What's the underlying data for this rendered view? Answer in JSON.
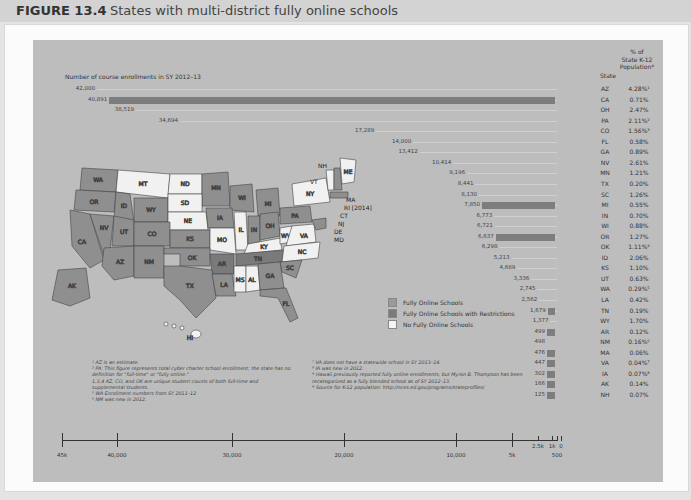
{
  "figure": {
    "number": "FIGURE 13.4",
    "title": "States with multi-district fully online schools"
  },
  "headers": {
    "enrollments": "Number of course enrollments in SY 2012–13",
    "state": "State",
    "pct_line1": "% of",
    "pct_line2": "State K-12",
    "pct_line3": "Population*"
  },
  "legend": {
    "items": [
      {
        "label": "Fully Online Schools",
        "color": "#9a9a9a"
      },
      {
        "label": "Fully Online Schools with Restrictions",
        "color": "#7a7a7a"
      },
      {
        "label": "No Fully Online Schools",
        "color": "#f4f4f4"
      }
    ]
  },
  "notes_left": [
    "¹ AZ is an estimate.",
    "² PA: This figure represents total cyber charter school enrollment; the state has no definition for \"full-time\" or \"fully online.\"",
    "1,3,4 AZ, CO, and OK are unique student counts of both full-time and supplemental students.",
    "⁵ WA Enrollment numbers from SY 2011–12",
    "⁶ NM was new in 2012."
  ],
  "notes_right": [
    "⁷ VA does not have a statewide school in SY 2013–14.",
    "⁸ IA was new in 2012.",
    "* Hawaii previously reported fully online enrollments, but Myron B. Thompson has been recategorized as a fully blended school as of SY 2012–13.",
    "* Source for K-12 population: http://nces.ed.gov/programs/stateprofiles/"
  ],
  "map_labels": {
    "ri": "RI [2014]",
    "hi": "HI"
  },
  "axis": {
    "ticks": [
      {
        "label": "45k",
        "x": 62
      },
      {
        "label": "40,000",
        "x": 117
      },
      {
        "label": "30,000",
        "x": 232
      },
      {
        "label": "20,000",
        "x": 344
      },
      {
        "label": "10,000",
        "x": 456
      },
      {
        "label": "5k",
        "x": 512
      },
      {
        "label": "2.5k",
        "x": 538
      },
      {
        "label": "1k",
        "x": 552
      },
      {
        "label": "500",
        "x": 557
      },
      {
        "label": "0",
        "x": 561
      }
    ]
  },
  "chart_data": {
    "type": "bar",
    "title": "States with multi-district fully online schools",
    "xlabel": "Number of course enrollments in SY 2012–13",
    "ylabel": "State",
    "axis_ticks": [
      "45k",
      "40,000",
      "30,000",
      "20,000",
      "10,000",
      "5k",
      "2.5k",
      "1k",
      "500",
      "0"
    ],
    "categories": [
      "AZ",
      "CA",
      "OH",
      "PA",
      "CO",
      "FL",
      "GA",
      "NV",
      "MN",
      "TX",
      "SC",
      "MI",
      "IN",
      "WI",
      "OR",
      "OK",
      "ID",
      "KS",
      "UT",
      "WA",
      "LA",
      "TN",
      "WY",
      "AR",
      "NM",
      "MA",
      "VA",
      "IA",
      "AK",
      "NH"
    ],
    "values": [
      42000,
      40891,
      38519,
      34694,
      17289,
      14000,
      13412,
      10414,
      9196,
      8441,
      8130,
      7850,
      6773,
      6721,
      6637,
      6298,
      5213,
      4689,
      3336,
      2745,
      2562,
      1679,
      1377,
      499,
      498,
      476,
      447,
      302,
      166,
      125
    ],
    "value_labels": [
      "42,000",
      "40,891",
      "38,519",
      "34,694",
      "17,289",
      "14,000",
      "13,412",
      "10,414",
      "9,196",
      "8,441",
      "8,130",
      "7,850",
      "6,773",
      "6,721",
      "6,637",
      "6,298",
      "5,213",
      "4,689",
      "3,336",
      "2,745",
      "2,562",
      "1,679",
      "1,377",
      "499",
      "498",
      "476",
      "447",
      "302",
      "166",
      "125"
    ],
    "pct_k12": [
      "4.28%¹",
      "0.71%",
      "2.47%",
      "2.11%²",
      "1.56%³",
      "0.58%",
      "0.89%",
      "2.61%",
      "1.21%",
      "0.20%",
      "1.26%",
      "0.55%",
      "0.70%",
      "0.88%",
      "1.27%",
      "1.11%⁴",
      "2.06%",
      "1.10%",
      "0.63%",
      "0.29%⁵",
      "0.42%",
      "0.19%",
      "1.70%",
      "0.12%",
      "0.16%⁶",
      "0.06%",
      "0.04%⁷",
      "0.07%⁸",
      "0.14%",
      "0.07%"
    ],
    "highlighted": [
      "CA",
      "MI",
      "OR",
      "TN",
      "AR",
      "MA",
      "VA",
      "IA",
      "AK",
      "NH"
    ],
    "map_categories": {
      "fully_online": [
        "AZ",
        "CA",
        "OH",
        "PA",
        "CO",
        "FL",
        "GA",
        "NV",
        "MN",
        "TX",
        "SC",
        "MI",
        "IN",
        "WI",
        "OR",
        "OK",
        "ID",
        "KS",
        "UT",
        "WA",
        "LA",
        "WY",
        "NM",
        "VA",
        "IA",
        "AK",
        "NH",
        "MA",
        "NJ",
        "DE",
        "MD",
        "CT",
        "RI"
      ],
      "with_restrictions": [
        "TN",
        "AR"
      ],
      "none": [
        "MT",
        "ND",
        "SD",
        "NE",
        "MO",
        "IL",
        "KY",
        "WV",
        "NC",
        "MS",
        "AL",
        "NY",
        "VT",
        "ME",
        "HI"
      ]
    }
  }
}
